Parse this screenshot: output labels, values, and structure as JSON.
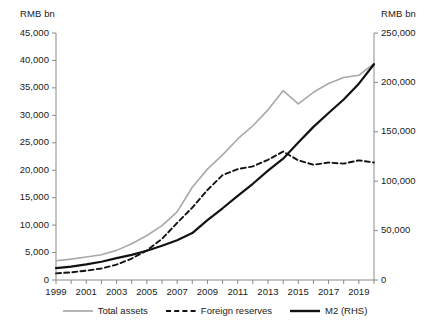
{
  "chart_data": {
    "type": "line",
    "title": "",
    "subtitle": "",
    "xlabel": "",
    "ylabel": "RMB bn",
    "y2label": "RMB bn",
    "grid": false,
    "legend_position": "bottom",
    "x": [
      1999,
      2000,
      2001,
      2002,
      2003,
      2004,
      2005,
      2006,
      2007,
      2008,
      2009,
      2010,
      2011,
      2012,
      2013,
      2014,
      2015,
      2016,
      2017,
      2018,
      2019,
      2020
    ],
    "xlim": [
      1999,
      2020
    ],
    "xtick_labels": [
      "1999",
      "2001",
      "2003",
      "2005",
      "2007",
      "2009",
      "2011",
      "2013",
      "2015",
      "2017",
      "2019"
    ],
    "xtick_values": [
      1999,
      2001,
      2003,
      2005,
      2007,
      2009,
      2011,
      2013,
      2015,
      2017,
      2019
    ],
    "ylim": [
      0,
      45000
    ],
    "ytick_labels": [
      "0",
      "5,000",
      "10,000",
      "15,000",
      "20,000",
      "25,000",
      "30,000",
      "35,000",
      "40,000",
      "45,000"
    ],
    "ytick_values": [
      0,
      5000,
      10000,
      15000,
      20000,
      25000,
      30000,
      35000,
      40000,
      45000
    ],
    "y2lim": [
      0,
      250000
    ],
    "y2tick_labels": [
      "0",
      "50,000",
      "100,000",
      "150,000",
      "200,000",
      "250,000"
    ],
    "y2tick_values": [
      0,
      50000,
      100000,
      150000,
      200000,
      250000
    ],
    "series": [
      {
        "name": "Total assets",
        "axis": "left",
        "style": "solid",
        "color": "#a9a9a9",
        "width": 1.6,
        "values": [
          3500,
          3800,
          4200,
          4600,
          5400,
          6600,
          8100,
          9900,
          12400,
          16900,
          20200,
          22800,
          25700,
          28100,
          31000,
          34500,
          32100,
          34200,
          35800,
          36900,
          37300,
          39400
        ]
      },
      {
        "name": "Foreign reserves",
        "axis": "left",
        "style": "dashed",
        "color": "#121212",
        "width": 1.9,
        "values": [
          1200,
          1400,
          1700,
          2100,
          2800,
          3900,
          5400,
          7500,
          10400,
          13200,
          16400,
          19100,
          20200,
          20700,
          21900,
          23400,
          21800,
          21000,
          21400,
          21200,
          21800,
          21400
        ]
      },
      {
        "name": "M2 (RHS)",
        "axis": "right",
        "style": "solid",
        "color": "#121212",
        "width": 2.2,
        "values": [
          12000,
          13500,
          15800,
          18500,
          22100,
          25400,
          29600,
          34600,
          40300,
          47500,
          60600,
          72600,
          85200,
          97400,
          110700,
          122800,
          139200,
          155000,
          169000,
          182700,
          198700,
          218400
        ]
      }
    ]
  },
  "legend": {
    "items": [
      {
        "label": "Total assets",
        "style": "solid",
        "color": "#a9a9a9"
      },
      {
        "label": "Foreign reserves",
        "style": "dashed",
        "color": "#121212"
      },
      {
        "label": "M2 (RHS)",
        "style": "solid-thick",
        "color": "#121212"
      }
    ]
  }
}
